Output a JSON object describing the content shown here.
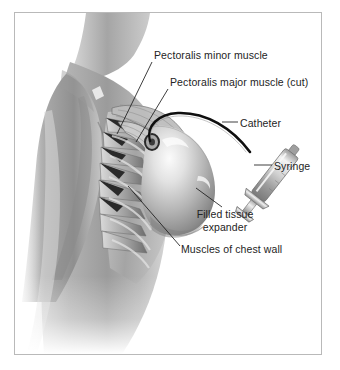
{
  "figure": {
    "kind": "medical-illustration",
    "view": "lateral oblique view of female chest and shoulder",
    "style": "grayscale airbrush anatomical illustration",
    "frame": {
      "border_color": "#b9b9b9",
      "background_color": "#ffffff"
    }
  },
  "labels": {
    "pectoralis_minor": "Pectoralis minor muscle",
    "pectoralis_major": "Pectoralis major muscle (cut)",
    "catheter": "Catheter",
    "syringe": "Syringe",
    "expander_line1": "Filled tissue",
    "expander_line2": "expander",
    "chest_wall": "Muscles of chest wall"
  },
  "colors": {
    "text": "#242424",
    "leader_line": "#1c1c1c",
    "catheter_tube": "#111111",
    "skin_light": "#e9e9e9",
    "skin_mid": "#b8b8b8",
    "skin_dark": "#8e8e8e",
    "muscle_light": "#d4d4d4",
    "muscle_dark": "#6f6f6f",
    "expander_highlight": "#f2f2f2",
    "expander_shadow": "#7e7e7e",
    "metal_light": "#efefef",
    "metal_dark": "#8a8a8a"
  },
  "anatomy_parts": [
    "neck",
    "shoulder",
    "upper arm",
    "torso",
    "serratus anterior muscle slips",
    "pectoralis major muscle (cut edge)",
    "pectoralis minor muscle",
    "filled tissue expander dome",
    "catheter port"
  ],
  "devices": [
    "catheter",
    "syringe"
  ]
}
